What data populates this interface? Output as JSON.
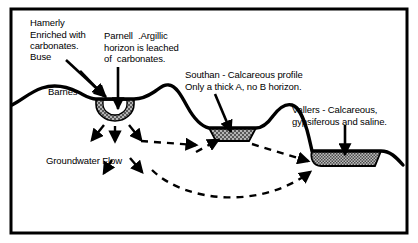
{
  "figure": {
    "border_color": "#000000",
    "background_color": "#ffffff",
    "terrain_line_color": "#000000",
    "soil_fill_color": "#a8a8a8",
    "flow_arrow_color": "#000000"
  },
  "labels": {
    "hamerly": "Hamerly\nEnriched with\ncarbonates.",
    "buse": "Buse",
    "barnes": "Barnes",
    "parnell": "Parnell  .Argillic\nhorizon is leached\nof  carbonates.",
    "southan": "Southan - Calcareous profile\nOnly a thick A, no B horizon.",
    "vallers": "Vallers - Calcareous,\ngypsiferous and saline.",
    "groundwater_flow": "Groundwater Flow"
  },
  "soil_units": [
    {
      "name": "Parnell",
      "description": "Argillic horizon is leached of carbonates.",
      "shape": "deep-bowl-depression",
      "fill": "stippled-gray-with-white-core"
    },
    {
      "name": "Southan",
      "description": "Calcareous profile. Only a thick A, no B horizon.",
      "shape": "shallow-trapezoid-basin",
      "fill": "stippled-gray"
    },
    {
      "name": "Vallers",
      "description": "Calcareous, gypsiferous and saline.",
      "shape": "wide-shallow-basin",
      "fill": "stippled-gray"
    },
    {
      "name": "Buse",
      "description": "Upland crest position.",
      "shape": "hill-crest",
      "fill": "none"
    },
    {
      "name": "Barnes",
      "description": "Upland slope position.",
      "shape": "hillslope",
      "fill": "none"
    },
    {
      "name": "Hamerly",
      "description": "Enriched with carbonates.",
      "shape": "lower-slope",
      "fill": "none"
    }
  ],
  "flow": {
    "label": "Groundwater Flow",
    "direction": "left-to-right, downslope then up toward Vallers basin",
    "style": "dashed arrows"
  }
}
